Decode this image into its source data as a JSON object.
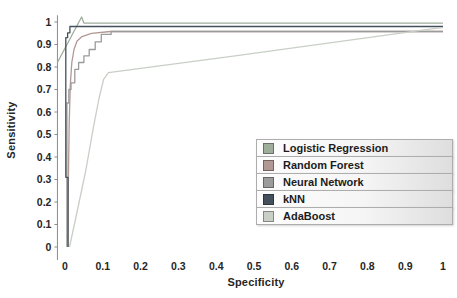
{
  "chart_data": {
    "type": "line",
    "title": "",
    "xlabel": "Specificity",
    "ylabel": "Sensitivity",
    "xlim": [
      -0.02,
      1.02
    ],
    "ylim": [
      0,
      1.03
    ],
    "grid": false,
    "legend_position": "inside-lower-right",
    "x_ticks": [
      {
        "label": "0",
        "value": 0
      },
      {
        "label": "0.1",
        "value": 0.1
      },
      {
        "label": "0.2",
        "value": 0.2
      },
      {
        "label": "0.3",
        "value": 0.3
      },
      {
        "label": "0.4",
        "value": 0.4
      },
      {
        "label": "0.5",
        "value": 0.5
      },
      {
        "label": "0.6",
        "value": 0.6
      },
      {
        "label": "0.7",
        "value": 0.7
      },
      {
        "label": "0.8",
        "value": 0.8
      },
      {
        "label": "0.9",
        "value": 0.9
      },
      {
        "label": "1",
        "value": 1
      }
    ],
    "y_ticks": [
      {
        "label": "1",
        "value": 1
      },
      {
        "label": "0.9",
        "value": 0.9
      },
      {
        "label": "0.8",
        "value": 0.8
      },
      {
        "label": "0.7",
        "value": 0.7
      },
      {
        "label": "0.6",
        "value": 0.6
      },
      {
        "label": "0.5",
        "value": 0.5
      },
      {
        "label": "0.4",
        "value": 0.4
      },
      {
        "label": "0.3",
        "value": 0.3
      },
      {
        "label": "0.2",
        "value": 0.2
      },
      {
        "label": "0.1",
        "value": 0.1
      },
      {
        "label": "0",
        "value": 0
      }
    ],
    "axis_color": "#8c8c8c",
    "tick_text_color": "#262626",
    "series": [
      {
        "name": "Logistic Regression",
        "color": "#9fae9b",
        "points": [
          [
            -0.02,
            0.82
          ],
          [
            0.044,
            1.022
          ],
          [
            0.05,
            0.995
          ],
          [
            1,
            0.995
          ]
        ]
      },
      {
        "name": "Random Forest",
        "color": "#b29892",
        "points": [
          [
            0.008,
            0
          ],
          [
            0.009,
            0.3
          ],
          [
            0.011,
            0.55
          ],
          [
            0.014,
            0.72
          ],
          [
            0.018,
            0.82
          ],
          [
            0.024,
            0.88
          ],
          [
            0.032,
            0.915
          ],
          [
            0.045,
            0.935
          ],
          [
            0.07,
            0.95
          ],
          [
            0.12,
            0.958
          ],
          [
            1,
            0.958
          ]
        ]
      },
      {
        "name": "Neural Network",
        "color": "#9b9b9b",
        "points": [
          [
            0.005,
            0
          ],
          [
            0.005,
            0.64
          ],
          [
            0.01,
            0.64
          ],
          [
            0.01,
            0.7
          ],
          [
            0.016,
            0.7
          ],
          [
            0.016,
            0.73
          ],
          [
            0.026,
            0.73
          ],
          [
            0.026,
            0.79
          ],
          [
            0.036,
            0.79
          ],
          [
            0.036,
            0.82
          ],
          [
            0.05,
            0.82
          ],
          [
            0.05,
            0.85
          ],
          [
            0.064,
            0.85
          ],
          [
            0.064,
            0.878
          ],
          [
            0.08,
            0.878
          ],
          [
            0.08,
            0.912
          ],
          [
            0.096,
            0.912
          ],
          [
            0.096,
            0.945
          ],
          [
            0.122,
            0.945
          ],
          [
            0.122,
            0.958
          ],
          [
            1,
            0.958
          ]
        ]
      },
      {
        "name": "kNN",
        "color": "#44505c",
        "points": [
          [
            0.008,
            0
          ],
          [
            0.008,
            0.31
          ],
          [
            0.002,
            0.31
          ],
          [
            0.002,
            0.93
          ],
          [
            0.007,
            0.93
          ],
          [
            0.007,
            0.952
          ],
          [
            0.013,
            0.952
          ],
          [
            0.013,
            0.98
          ],
          [
            1,
            0.98
          ]
        ]
      },
      {
        "name": "AdaBoost",
        "color": "#c9cfc6",
        "points": [
          [
            0.012,
            0
          ],
          [
            0.03,
            0.14
          ],
          [
            0.055,
            0.34
          ],
          [
            0.075,
            0.53
          ],
          [
            0.09,
            0.66
          ],
          [
            0.102,
            0.745
          ],
          [
            0.115,
            0.775
          ],
          [
            0.45,
            0.85
          ],
          [
            0.98,
            0.972
          ],
          [
            1,
            0.975
          ]
        ]
      }
    ]
  }
}
